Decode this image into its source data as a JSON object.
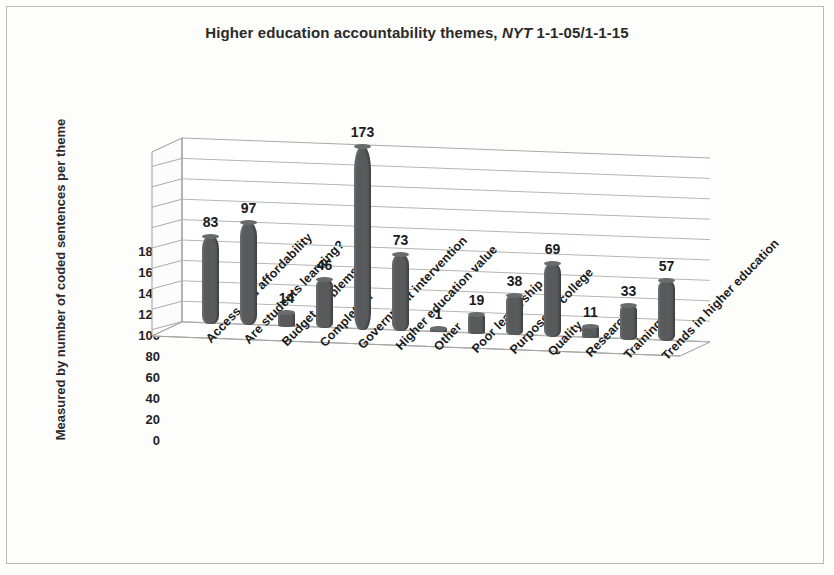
{
  "figure": {
    "title_main": "Higher education accountability themes, ",
    "title_source": "NYT",
    "title_range": " 1-1-05/1-1-15",
    "y_axis_title": "Measured by number of coded sentences per theme"
  },
  "chart_data": {
    "type": "bar",
    "title": "Higher education accountability themes, NYT 1-1-05/1-1-15",
    "xlabel": "",
    "ylabel": "Measured by number of coded sentences per theme",
    "ylim": [
      0,
      180
    ],
    "yticks": [
      180,
      160,
      140,
      120,
      100,
      80,
      60,
      40,
      20,
      0
    ],
    "grid": true,
    "legend": "none",
    "three_d": true,
    "categories": [
      "Access and affordability",
      "Are students learning?",
      "Budget problems",
      "Completion",
      "Government intervention",
      "Higher education value",
      "Other",
      "Poor leadership",
      "Purpose of college",
      "Quality",
      "Research",
      "Training",
      "Trends in higher education"
    ],
    "values": [
      83,
      97,
      14,
      46,
      173,
      73,
      1,
      19,
      38,
      69,
      11,
      33,
      57
    ],
    "bar_color": "#595a5c"
  }
}
